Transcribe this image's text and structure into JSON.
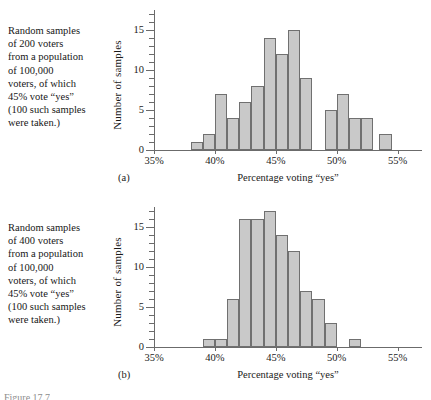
{
  "figure": {
    "reference": "Figure 17.7"
  },
  "panels": [
    {
      "id": "a",
      "sublabel": "(a)",
      "caption_lines": [
        "Random samples",
        "of 200 voters",
        "from a population",
        "of 100,000",
        "voters, of which",
        "45% vote “yes”",
        "(100 such samples",
        "were taken.)"
      ],
      "chart_data": {
        "type": "bar",
        "title": "",
        "xlabel": "Percentage voting “yes”",
        "ylabel": "Number of samples",
        "xlim": [
          35,
          57
        ],
        "ylim": [
          0,
          17.5
        ],
        "bin_width": 1,
        "grid": false,
        "legend": "none",
        "xtick_labels": [
          "35%",
          "40%",
          "45%",
          "50%",
          "55%"
        ],
        "xtick_values": [
          35,
          40,
          45,
          50,
          55
        ],
        "ytick_labels": [
          "0",
          "5",
          "10",
          "15"
        ],
        "ytick_values": [
          0,
          5,
          10,
          15
        ],
        "yminor_step": 1,
        "bin_starts": [
          38,
          39,
          40,
          41,
          42,
          43,
          44,
          45,
          46,
          47,
          48,
          49,
          50,
          51,
          52,
          53
        ],
        "values": [
          1,
          2,
          7,
          4,
          6,
          8,
          14,
          12,
          15,
          9,
          0,
          5,
          7,
          4,
          4,
          0
        ],
        "extra_bin_start": 53.5,
        "extra_value": 2
      }
    },
    {
      "id": "b",
      "sublabel": "(b)",
      "caption_lines": [
        "Random samples",
        "of 400 voters",
        "from a population",
        "of 100,000",
        "voters, of which",
        "45% vote “yes”",
        "(100 such samples",
        "were taken.)"
      ],
      "chart_data": {
        "type": "bar",
        "title": "",
        "xlabel": "Percentage voting “yes”",
        "ylabel": "Number of samples",
        "xlim": [
          35,
          57
        ],
        "ylim": [
          0,
          17.5
        ],
        "bin_width": 1,
        "grid": false,
        "legend": "none",
        "xtick_labels": [
          "35%",
          "40%",
          "45%",
          "50%",
          "55%"
        ],
        "xtick_values": [
          35,
          40,
          45,
          50,
          55
        ],
        "ytick_labels": [
          "0",
          "5",
          "10",
          "15"
        ],
        "ytick_values": [
          0,
          5,
          10,
          15
        ],
        "yminor_step": 1,
        "bin_starts": [
          39,
          40,
          41,
          42,
          43,
          44,
          45,
          46,
          47,
          48,
          49,
          50,
          51
        ],
        "values": [
          1,
          1,
          6,
          16,
          16,
          17,
          14,
          12,
          7,
          6,
          3,
          0,
          1
        ]
      }
    }
  ],
  "colors": {
    "bar_fill": "#c9c9c9",
    "bar_stroke": "#707070",
    "axis": "#6b6b6b",
    "text": "#171717"
  }
}
